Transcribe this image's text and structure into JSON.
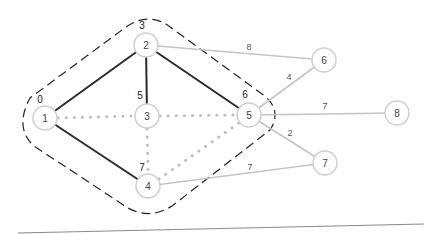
{
  "diagram": {
    "title": "",
    "nodes": [
      {
        "id": "1",
        "label": "1",
        "distance": "0",
        "x": 45,
        "y": 118
      },
      {
        "id": "2",
        "label": "2",
        "distance": "3",
        "x": 146,
        "y": 45
      },
      {
        "id": "3",
        "label": "3",
        "distance": "5",
        "x": 147,
        "y": 116
      },
      {
        "id": "4",
        "label": "4",
        "distance": "7",
        "x": 148,
        "y": 186
      },
      {
        "id": "5",
        "label": "5",
        "distance": "6",
        "x": 249,
        "y": 115
      },
      {
        "id": "6",
        "label": "6",
        "distance": "",
        "x": 324,
        "y": 60
      },
      {
        "id": "7",
        "label": "7",
        "distance": "",
        "x": 325,
        "y": 163
      },
      {
        "id": "8",
        "label": "8",
        "distance": "",
        "x": 397,
        "y": 113
      }
    ],
    "edges": [
      {
        "from": "1",
        "to": "2",
        "style": "tree",
        "weight": ""
      },
      {
        "from": "2",
        "to": "3",
        "style": "tree",
        "weight": ""
      },
      {
        "from": "2",
        "to": "5",
        "style": "tree",
        "weight": ""
      },
      {
        "from": "1",
        "to": "4",
        "style": "tree",
        "weight": ""
      },
      {
        "from": "1",
        "to": "3",
        "style": "dotted",
        "weight": ""
      },
      {
        "from": "3",
        "to": "5",
        "style": "dotted",
        "weight": ""
      },
      {
        "from": "3",
        "to": "4",
        "style": "dotted",
        "weight": ""
      },
      {
        "from": "4",
        "to": "5",
        "style": "dotted",
        "weight": ""
      },
      {
        "from": "2",
        "to": "6",
        "style": "light",
        "weight": "8"
      },
      {
        "from": "5",
        "to": "6",
        "style": "light",
        "weight": "4"
      },
      {
        "from": "5",
        "to": "8",
        "style": "light",
        "weight": "7"
      },
      {
        "from": "5",
        "to": "7",
        "style": "light",
        "weight": "2"
      },
      {
        "from": "4",
        "to": "7",
        "style": "light",
        "weight": "7"
      }
    ],
    "weight_labels": {
      "e26": "8",
      "e56": "4",
      "e58": "7",
      "e57": "2",
      "e47": "7"
    },
    "colors": {
      "tree_edge": "#2a2a2a",
      "dotted_edge": "#bdbdbd",
      "light_edge": "#c4c4c4",
      "node_stroke": "#cfcfcf",
      "cluster_stroke": "#222222"
    }
  }
}
